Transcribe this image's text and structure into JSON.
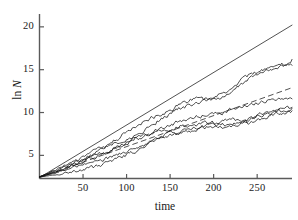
{
  "chart_data": {
    "type": "line",
    "title": "",
    "subtitle": "",
    "xlabel": "time",
    "ylabel": "ln N",
    "ylabel_prefix": "ln ",
    "ylabel_var": "N",
    "xlim": [
      0,
      290
    ],
    "ylim": [
      2.3,
      21.5
    ],
    "xticks": [
      50,
      100,
      150,
      200,
      250
    ],
    "xtick_labels": [
      "50",
      "100",
      "150",
      "200",
      "250"
    ],
    "yticks": [
      5,
      10,
      15,
      20
    ],
    "ytick_labels": [
      "5",
      "10",
      "15",
      "20"
    ],
    "grid": false,
    "legend": "none",
    "axis_color": "#555555",
    "line_color": "#111111",
    "reference_line_color": "#333333",
    "background": "#ffffff",
    "series": [
      {
        "name": "upper-reference-line",
        "style": "solid",
        "role": "reference",
        "slope": 0.0615,
        "intercept": 2.4,
        "x": [
          0,
          290
        ],
        "values": [
          2.4,
          20.2
        ]
      },
      {
        "name": "dashed-reference-line",
        "style": "dashed",
        "role": "reference",
        "slope": 0.0363,
        "intercept": 2.4,
        "x": [
          0,
          290
        ],
        "values": [
          2.4,
          12.9
        ]
      },
      {
        "name": "trajectory-1",
        "style": "solid",
        "role": "random-walk",
        "x": [
          0,
          10,
          20,
          30,
          40,
          50,
          60,
          70,
          80,
          90,
          100,
          110,
          120,
          130,
          140,
          150,
          160,
          170,
          180,
          190,
          200,
          210,
          220,
          230,
          240,
          250,
          260,
          270,
          280,
          290
        ],
        "values": [
          2.5,
          2.9,
          3.4,
          3.9,
          4.5,
          4.9,
          5.3,
          5.8,
          6.2,
          6.4,
          6.7,
          7.3,
          7.9,
          8.6,
          9.3,
          9.9,
          10.4,
          10.8,
          11.1,
          11.4,
          11.6,
          12.2,
          12.9,
          13.6,
          14.3,
          14.8,
          15.1,
          15.4,
          15.6,
          16.2
        ]
      },
      {
        "name": "trajectory-2",
        "style": "solid",
        "role": "random-walk",
        "x": [
          0,
          10,
          20,
          30,
          40,
          50,
          60,
          70,
          80,
          90,
          100,
          110,
          120,
          130,
          140,
          150,
          160,
          170,
          180,
          190,
          200,
          210,
          220,
          230,
          240,
          250,
          260,
          270,
          280,
          290
        ],
        "values": [
          2.5,
          2.8,
          3.2,
          3.6,
          4.0,
          4.4,
          5.0,
          5.6,
          6.3,
          7.0,
          7.7,
          8.3,
          8.9,
          9.4,
          9.8,
          10.3,
          10.9,
          11.3,
          11.6,
          11.5,
          11.4,
          11.8,
          12.5,
          13.2,
          14.0,
          14.6,
          15.0,
          15.2,
          15.4,
          15.5
        ]
      },
      {
        "name": "trajectory-3",
        "style": "solid",
        "role": "random-walk",
        "x": [
          0,
          10,
          20,
          30,
          40,
          50,
          60,
          70,
          80,
          90,
          100,
          110,
          120,
          130,
          140,
          150,
          160,
          170,
          180,
          190,
          200,
          210,
          220,
          230,
          240,
          250,
          260,
          270,
          280,
          290
        ],
        "values": [
          2.5,
          2.9,
          3.3,
          3.7,
          4.2,
          4.7,
          5.1,
          5.4,
          5.6,
          6.0,
          6.5,
          7.0,
          7.4,
          7.8,
          8.1,
          8.5,
          8.9,
          9.2,
          9.5,
          9.7,
          9.8,
          10.0,
          10.3,
          10.6,
          10.9,
          11.2,
          11.4,
          11.5,
          11.6,
          11.6
        ]
      },
      {
        "name": "trajectory-4",
        "style": "solid",
        "role": "random-walk",
        "x": [
          0,
          10,
          20,
          30,
          40,
          50,
          60,
          70,
          80,
          90,
          100,
          110,
          120,
          130,
          140,
          150,
          160,
          170,
          180,
          190,
          200,
          210,
          220,
          230,
          240,
          250,
          260,
          270,
          280,
          290
        ],
        "values": [
          2.5,
          2.7,
          3.0,
          3.4,
          3.9,
          4.3,
          4.6,
          5.0,
          5.5,
          6.1,
          6.6,
          6.9,
          7.1,
          7.4,
          7.8,
          8.1,
          8.3,
          8.5,
          8.6,
          8.8,
          8.5,
          8.1,
          8.3,
          8.7,
          9.2,
          9.6,
          10.0,
          10.3,
          10.5,
          10.6
        ]
      },
      {
        "name": "trajectory-5",
        "style": "solid",
        "role": "random-walk",
        "x": [
          0,
          10,
          20,
          30,
          40,
          50,
          60,
          70,
          80,
          90,
          100,
          110,
          120,
          130,
          140,
          150,
          160,
          170,
          180,
          190,
          200,
          210,
          220,
          230,
          240,
          250,
          260,
          270,
          280,
          290
        ],
        "values": [
          2.5,
          2.8,
          3.1,
          3.3,
          3.6,
          3.8,
          4.0,
          4.3,
          4.7,
          5.1,
          5.4,
          5.8,
          6.3,
          6.8,
          7.2,
          7.6,
          7.8,
          8.0,
          8.2,
          8.5,
          8.8,
          9.1,
          9.3,
          9.0,
          8.8,
          9.1,
          9.5,
          9.9,
          10.2,
          10.5
        ]
      },
      {
        "name": "trajectory-6",
        "style": "solid",
        "role": "random-walk",
        "x": [
          0,
          10,
          20,
          30,
          40,
          50,
          60,
          70,
          80,
          90,
          100,
          110,
          120,
          130,
          140,
          150,
          160,
          170,
          180,
          190,
          200,
          210,
          220,
          230,
          240,
          250,
          260,
          270,
          280,
          290
        ],
        "values": [
          2.5,
          2.6,
          2.8,
          3.0,
          3.2,
          3.3,
          3.5,
          3.8,
          4.2,
          4.6,
          5.0,
          5.5,
          6.1,
          6.6,
          7.0,
          7.4,
          7.7,
          7.9,
          8.0,
          8.2,
          8.4,
          8.6,
          8.8,
          9.0,
          9.3,
          9.6,
          9.8,
          9.9,
          10.0,
          10.2
        ]
      }
    ]
  }
}
